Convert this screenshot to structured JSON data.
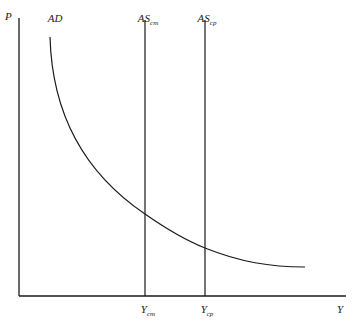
{
  "diagram": {
    "type": "economics AD-AS diagram",
    "axes": {
      "y_label": "P",
      "x_label": "Y"
    },
    "curves": [
      {
        "id": "ad",
        "label": "AD",
        "subscript": "",
        "kind": "downward-sloping convex curve"
      },
      {
        "id": "as_cm",
        "label": "AS",
        "subscript": "cm",
        "kind": "vertical line"
      },
      {
        "id": "as_cp",
        "label": "AS",
        "subscript": "cp",
        "kind": "vertical line"
      }
    ],
    "x_ticks": [
      {
        "id": "y_cm",
        "label": "Y",
        "subscript": "cm"
      },
      {
        "id": "y_cp",
        "label": "Y",
        "subscript": "cp"
      }
    ],
    "colors": {
      "line": "#1a1a1a",
      "background": "#ffffff"
    }
  }
}
